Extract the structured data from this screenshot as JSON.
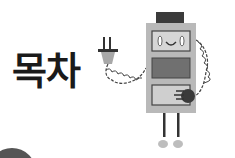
{
  "title": "목차",
  "illustration": {
    "subject": "robot-with-plug",
    "colors": {
      "body": "#b9b9b9",
      "head_cap": "#3b3b3b",
      "screen_top": "#d6d6d6",
      "screen_middle": "#707070",
      "screen_bottom": "#cfcfcf",
      "outline": "#444444",
      "plug": "#a8a8a8",
      "feet": "#bdbdbd"
    }
  }
}
